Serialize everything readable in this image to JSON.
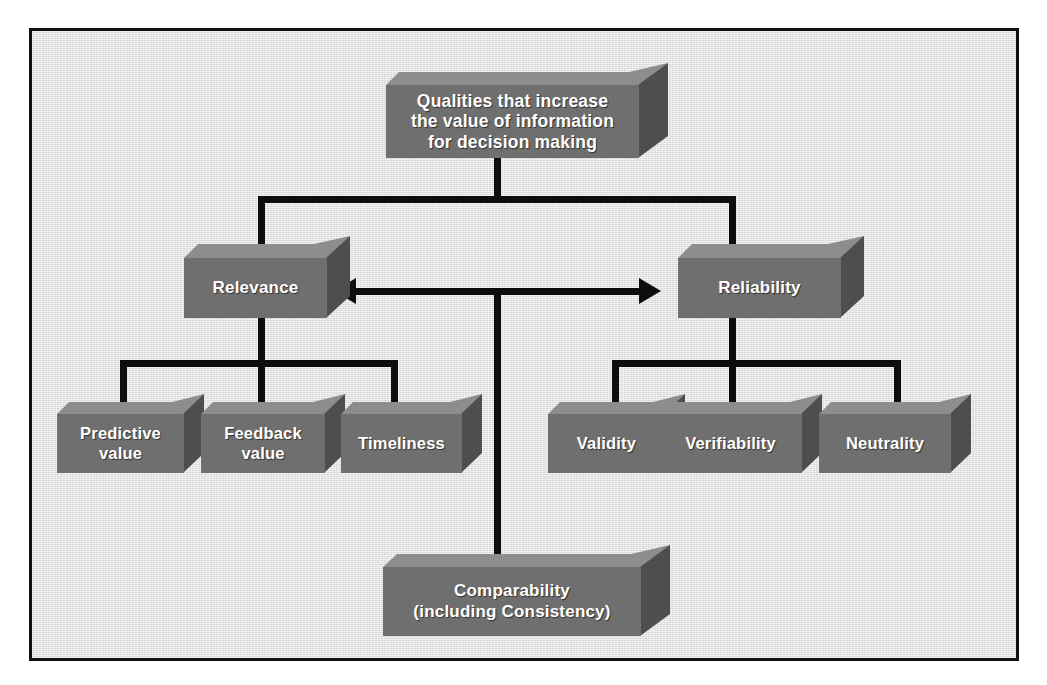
{
  "diagram": {
    "title_node": {
      "label": "Qualities that increase\nthe value of information\nfor decision making"
    },
    "level2": [
      {
        "id": "relevance",
        "label": "Relevance"
      },
      {
        "id": "reliability",
        "label": "Reliability"
      }
    ],
    "relevance_children": [
      {
        "id": "predictive-value",
        "label": "Predictive\nvalue"
      },
      {
        "id": "feedback-value",
        "label": "Feedback\nvalue"
      },
      {
        "id": "timeliness",
        "label": "Timeliness"
      }
    ],
    "reliability_children": [
      {
        "id": "validity",
        "label": "Validity"
      },
      {
        "id": "verifiability",
        "label": "Verifiability"
      },
      {
        "id": "neutrality",
        "label": "Neutrality"
      }
    ],
    "bottom_node": {
      "label": "Comparability\n(including Consistency)"
    },
    "arrow": {
      "name": "double-headed-arrow",
      "direction": "bidirectional",
      "from": "Relevance",
      "to": "Reliability"
    },
    "colors": {
      "background": "#e2e2e2",
      "frame_border": "#111111",
      "box_front": "#6f6f6f",
      "box_top": "#8d8d8d",
      "box_side": "#4e4e4e",
      "connector": "#0d0d0d",
      "label_text": "#ffffff"
    }
  }
}
